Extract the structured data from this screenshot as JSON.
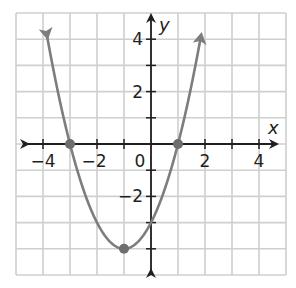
{
  "chart_data": {
    "type": "line",
    "title": "",
    "xlabel": "x",
    "ylabel": "y",
    "xlim": [
      -5,
      5
    ],
    "ylim": [
      -5,
      5
    ],
    "grid": true,
    "grid_step": 1,
    "x_tick_labels": [
      {
        "value": -4,
        "label": "−4"
      },
      {
        "value": -2,
        "label": "−2"
      },
      {
        "value": 0,
        "label": "0"
      },
      {
        "value": 2,
        "label": "2"
      },
      {
        "value": 4,
        "label": "4"
      }
    ],
    "y_tick_labels": [
      {
        "value": 4,
        "label": "4"
      },
      {
        "value": 2,
        "label": "2"
      },
      {
        "value": -2,
        "label": "−2"
      }
    ],
    "series": [
      {
        "name": "parabola",
        "equation": "y = x^2 + 2x - 3",
        "coefficients": {
          "a": 1,
          "b": 2,
          "c": -3
        },
        "x_range": [
          -3.85,
          1.85
        ],
        "arrows_at_ends": true,
        "color": "#7d7d7d"
      }
    ],
    "points": [
      {
        "name": "x-intercept-left",
        "x": -3,
        "y": 0
      },
      {
        "name": "vertex",
        "x": -1,
        "y": -4
      },
      {
        "name": "x-intercept-right",
        "x": 1,
        "y": 0
      }
    ],
    "colors": {
      "grid": "#cfcfcf",
      "axis": "#231f20",
      "curve": "#7d7d7d",
      "point": "#6e6e6e"
    }
  }
}
